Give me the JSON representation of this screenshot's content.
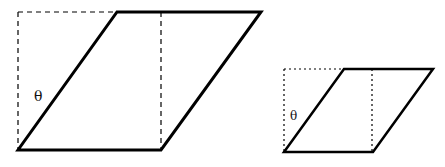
{
  "diagram": {
    "stroke_color": "#000000",
    "figures": [
      {
        "name": "large-parallelogram",
        "angle_label": "θ",
        "label_pos": [
          35,
          101
        ],
        "solid_points": "18,150 161,150 261,12 117,12",
        "guide_lines": [
          {
            "x1": 18,
            "y1": 12,
            "x2": 117,
            "y2": 12
          },
          {
            "x1": 18,
            "y1": 12,
            "x2": 18,
            "y2": 150
          },
          {
            "x1": 161,
            "y1": 12,
            "x2": 161,
            "y2": 150
          }
        ],
        "guide_style": "dashed"
      },
      {
        "name": "small-parallelogram",
        "angle_label": "θ",
        "label_pos": [
          290,
          119
        ],
        "solid_points": "284,152 373,152 433,69 344,69",
        "guide_lines": [
          {
            "x1": 284,
            "y1": 69,
            "x2": 344,
            "y2": 69
          },
          {
            "x1": 284,
            "y1": 69,
            "x2": 284,
            "y2": 152
          },
          {
            "x1": 372,
            "y1": 69,
            "x2": 372,
            "y2": 152
          }
        ],
        "guide_style": "dotted"
      }
    ]
  }
}
